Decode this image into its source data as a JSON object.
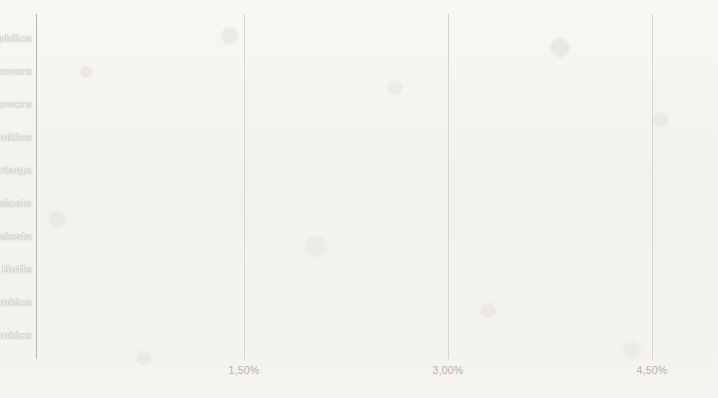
{
  "chart_data": {
    "type": "bar",
    "orientation": "horizontal",
    "title": "",
    "subtitle": "",
    "xlabel": "",
    "ylabel": "",
    "categories": [
      "Technophiles",
      "Movie Lovers",
      "TV Lovers",
      "News Junkies/Entertainment & Celebrity News Junkies",
      "Shutterbugs",
      "Mobile Enthusiasts",
      "Social Media Enthusiasts",
      "Travel Buffs",
      "News Junkies/Political News Junkies",
      "News Junkies"
    ],
    "values": [
      4.81,
      4.07,
      3.69,
      3.4,
      3.37,
      2.98,
      2.93,
      2.9,
      2.84,
      2.76
    ],
    "value_unit": "%",
    "xlim": [
      0,
      5.1
    ],
    "tick_values": [
      1.5,
      3.0,
      4.5
    ],
    "tick_labels": [
      "1,50%",
      "3,00%",
      "4,50%"
    ],
    "grid": "vertical-only",
    "legend": null,
    "bar_color": "#6f6b63",
    "label_color": "#f2f1ee",
    "axis_color": "#b4b1ab",
    "gridline_color": "#d9d6d0",
    "background_color": "#f6f4f1",
    "labels_inside_bars": true
  }
}
